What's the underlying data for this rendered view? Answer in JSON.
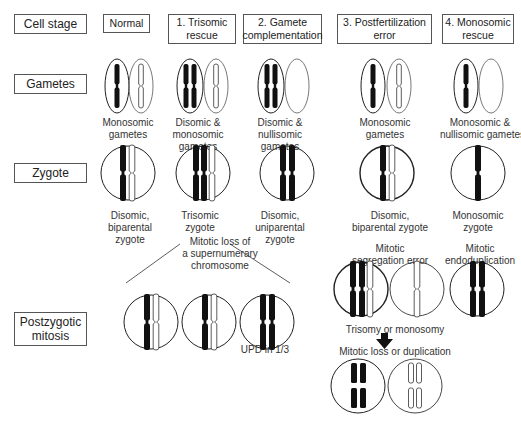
{
  "row_labels": {
    "cell_stage": "Cell stage",
    "gametes": "Gametes",
    "zygote": "Zygote",
    "postzygotic": [
      "Postzygotic",
      "mitosis"
    ]
  },
  "columns": [
    {
      "id": "normal",
      "header": [
        "Normal"
      ],
      "gametes_caption": [
        "Monosomic",
        "gametes"
      ],
      "zygote_caption": [
        "Disomic,",
        "biparental",
        "zygote"
      ]
    },
    {
      "id": "trisomic-rescue",
      "header": [
        "1. Trisomic",
        "rescue"
      ],
      "gametes_caption": [
        "Disomic &",
        "monosomic",
        "gametes"
      ],
      "zygote_caption": [
        "Trisomic",
        "zygote"
      ]
    },
    {
      "id": "gamete-complementation",
      "header": [
        "2. Gamete",
        "complementation"
      ],
      "gametes_caption": [
        "Disomic &",
        "nullisomic",
        "gametes"
      ],
      "zygote_caption": [
        "Disomic,",
        "uniparental",
        "zygote"
      ]
    },
    {
      "id": "postfertilization-error",
      "header": [
        "3. Postfertilization",
        "error"
      ],
      "gametes_caption": [
        "Monosomic",
        "gametes"
      ],
      "zygote_caption": [
        "Disomic,",
        "biparental zygote"
      ]
    },
    {
      "id": "monosomic-rescue",
      "header": [
        "4. Monosomic",
        "rescue"
      ],
      "gametes_caption": [
        "Monosomic &",
        "nullisomic gametes"
      ],
      "zygote_caption": [
        "Monosomic",
        "zygote"
      ]
    }
  ],
  "annotations": {
    "mitotic_loss": [
      "Mitotic loss of",
      "a supernumerary",
      "chromosome"
    ],
    "upd": "UPD in 1/3",
    "segregation_error": [
      "Mitotic",
      "segregation error"
    ],
    "endoduplication": [
      "Mitotic",
      "endoduplication"
    ],
    "trisomy_monosomy": "Trisomy or monosomy",
    "loss_or_duplication": "Mitotic loss or duplication"
  },
  "colors": {
    "line": "#222222",
    "box_border": "#555555",
    "chromosome_dark": "#111111"
  }
}
